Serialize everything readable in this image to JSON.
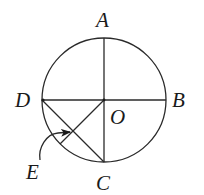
{
  "diagram": {
    "type": "geometry",
    "circle": {
      "center": "O",
      "cx": 104,
      "cy": 100,
      "r": 62
    },
    "points": {
      "A": {
        "label": "A",
        "x": 104,
        "y": 38
      },
      "B": {
        "label": "B",
        "x": 166,
        "y": 100
      },
      "C": {
        "label": "C",
        "x": 104,
        "y": 162
      },
      "D": {
        "label": "D",
        "x": 42,
        "y": 100
      },
      "O": {
        "label": "O",
        "x": 104,
        "y": 100
      },
      "E": {
        "label": "E",
        "x": 73,
        "y": 131
      }
    },
    "labels": {
      "A": "A",
      "B": "B",
      "C": "C",
      "D": "D",
      "O": "O",
      "E": "E"
    },
    "segments": [
      {
        "from": "A",
        "to": "C",
        "description": "vertical diameter"
      },
      {
        "from": "D",
        "to": "B",
        "description": "horizontal diameter"
      },
      {
        "from": "D",
        "to": "C",
        "description": "chord DC"
      },
      {
        "from": "O",
        "to": "arc",
        "description": "radius through E to arc"
      }
    ],
    "annotation": {
      "type": "curved-arrow",
      "from_label": "E",
      "points_to": "intersection of DC and OE"
    },
    "stroke_color": "#2a2a2a",
    "background": "#ffffff"
  }
}
